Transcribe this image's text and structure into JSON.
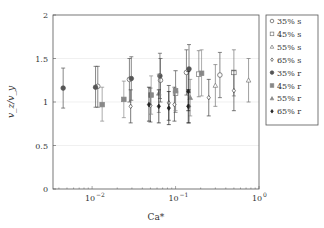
{
  "chart_data": {
    "type": "scatter",
    "title": "",
    "xlabel": "Ca*",
    "ylabel": "v_z / v_y",
    "xscale": "log",
    "xlim": [
      0.0034,
      1.0
    ],
    "ylim": [
      0,
      2
    ],
    "x_ticks": [
      {
        "value": 0.01,
        "label": "10",
        "exp": "−2"
      },
      {
        "value": 0.1,
        "label": "10",
        "exp": "−1"
      },
      {
        "value": 1.0,
        "label": "10",
        "exp": "0"
      }
    ],
    "y_ticks": [
      {
        "value": 0,
        "label": "0"
      },
      {
        "value": 0.5,
        "label": "0.5"
      },
      {
        "value": 1,
        "label": "1"
      },
      {
        "value": 1.5,
        "label": "1.5"
      },
      {
        "value": 2,
        "label": "2"
      }
    ],
    "grid": {
      "horizontal": true,
      "vertical": false
    },
    "legend_position": "right-outside",
    "series": [
      {
        "name": "35% s",
        "marker": "circle-open",
        "color": "#555555",
        "points": [
          {
            "x": 0.0117,
            "y": 1.18,
            "lo": 0.94,
            "hi": 1.41
          },
          {
            "x": 0.028,
            "y": 1.26,
            "lo": 1.0,
            "hi": 1.5
          },
          {
            "x": 0.066,
            "y": 1.25,
            "lo": 1.0,
            "hi": 1.5
          },
          {
            "x": 0.135,
            "y": 1.34,
            "lo": 1.08,
            "hi": 1.6
          },
          {
            "x": 0.34,
            "y": 1.31,
            "lo": 1.05,
            "hi": 1.57
          }
        ]
      },
      {
        "name": "45% s",
        "marker": "square-open",
        "color": "#777777",
        "points": [
          {
            "x": 0.1,
            "y": 1.1,
            "lo": 0.88,
            "hi": 1.36
          },
          {
            "x": 0.19,
            "y": 1.32,
            "lo": 1.06,
            "hi": 1.59
          },
          {
            "x": 0.5,
            "y": 1.34,
            "lo": 1.07,
            "hi": 1.6
          }
        ]
      },
      {
        "name": "55% s",
        "marker": "triangle-open",
        "color": "#777777",
        "points": [
          {
            "x": 0.3,
            "y": 1.19,
            "lo": 0.95,
            "hi": 1.43
          },
          {
            "x": 0.75,
            "y": 1.25,
            "lo": 1.0,
            "hi": 1.5
          }
        ]
      },
      {
        "name": "65% s",
        "marker": "diamond-open",
        "color": "#444444",
        "points": [
          {
            "x": 0.029,
            "y": 0.95,
            "lo": 0.76,
            "hi": 1.14
          },
          {
            "x": 0.05,
            "y": 0.96,
            "lo": 0.77,
            "hi": 1.16
          },
          {
            "x": 0.083,
            "y": 0.99,
            "lo": 0.79,
            "hi": 1.19
          },
          {
            "x": 0.097,
            "y": 0.97,
            "lo": 0.78,
            "hi": 1.17
          },
          {
            "x": 0.145,
            "y": 0.95,
            "lo": 0.76,
            "hi": 1.14
          },
          {
            "x": 0.25,
            "y": 1.05,
            "lo": 0.84,
            "hi": 1.26
          },
          {
            "x": 0.5,
            "y": 1.13,
            "lo": 0.9,
            "hi": 1.36
          }
        ]
      },
      {
        "name": "35% r",
        "marker": "circle-filled",
        "color": "#555555",
        "points": [
          {
            "x": 0.0045,
            "y": 1.16,
            "lo": 0.93,
            "hi": 1.39
          },
          {
            "x": 0.011,
            "y": 1.17,
            "lo": 0.94,
            "hi": 1.41
          },
          {
            "x": 0.0295,
            "y": 1.27,
            "lo": 1.02,
            "hi": 1.52
          },
          {
            "x": 0.065,
            "y": 1.3,
            "lo": 1.04,
            "hi": 1.56
          },
          {
            "x": 0.145,
            "y": 1.38,
            "lo": 1.11,
            "hi": 1.66
          }
        ]
      },
      {
        "name": "45% r",
        "marker": "square-filled",
        "color": "#888888",
        "points": [
          {
            "x": 0.0132,
            "y": 0.97,
            "lo": 0.78,
            "hi": 1.17
          },
          {
            "x": 0.024,
            "y": 1.03,
            "lo": 0.82,
            "hi": 1.24
          },
          {
            "x": 0.051,
            "y": 1.08,
            "lo": 0.86,
            "hi": 1.3
          },
          {
            "x": 0.1,
            "y": 1.13,
            "lo": 0.9,
            "hi": 1.36
          },
          {
            "x": 0.205,
            "y": 1.33,
            "lo": 1.07,
            "hi": 1.6
          }
        ]
      },
      {
        "name": "55% r",
        "marker": "triangle-filled",
        "color": "#888888",
        "points": [
          {
            "x": 0.063,
            "y": 1.1,
            "lo": 0.88,
            "hi": 1.32
          },
          {
            "x": 0.15,
            "y": 1.05,
            "lo": 0.84,
            "hi": 1.26
          }
        ]
      },
      {
        "name": "65% r",
        "marker": "diamond-filled",
        "color": "#222222",
        "points": [
          {
            "x": 0.048,
            "y": 0.97,
            "lo": 0.78,
            "hi": 1.17
          },
          {
            "x": 0.063,
            "y": 0.95,
            "lo": 0.76,
            "hi": 1.14
          },
          {
            "x": 0.083,
            "y": 0.93,
            "lo": 0.74,
            "hi": 1.12
          },
          {
            "x": 0.142,
            "y": 1.12,
            "lo": 0.9,
            "hi": 1.35
          },
          {
            "x": 0.142,
            "y": 0.95,
            "lo": 0.76,
            "hi": 1.14
          }
        ]
      }
    ]
  }
}
